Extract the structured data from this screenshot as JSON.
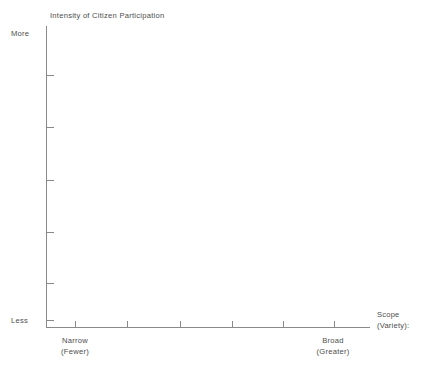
{
  "chart_data": {
    "type": "scatter",
    "title": "Intensity of Citizen Participation",
    "subtitle": "",
    "xlabel": "Scope (Variety):",
    "ylabel": "Intensity of Citizen Participation",
    "grid": false,
    "legend": null,
    "series": [],
    "annotations": [],
    "x_axis": {
      "label_line1": "Scope",
      "label_line2": "(Variety):",
      "low_end_line1": "Narrow",
      "low_end_line2": "(Fewer)",
      "high_end_line1": "Broad",
      "high_end_line2": "(Greater)",
      "tick_count": 6,
      "tick_positions": [
        75,
        127,
        180,
        232,
        283,
        334
      ],
      "tick_labels": [
        "",
        "",
        "",
        "",
        "",
        ""
      ]
    },
    "y_axis": {
      "label": "Intensity of Citizen Participation",
      "high_end": "More",
      "low_end": "Less",
      "tick_count": 6,
      "tick_positions": [
        75,
        127,
        180,
        232,
        283,
        320
      ],
      "tick_labels": [
        "",
        "",
        "",
        "",
        "",
        ""
      ]
    }
  },
  "figure": {
    "title": "Intensity of Citizen Participation",
    "y_axis_more_label": "More",
    "y_axis_less_label": "Less",
    "x_axis_narrow_label": "Narrow",
    "x_axis_narrow_sublabel": "(Fewer)",
    "x_axis_broad_label": "Broad",
    "x_axis_broad_sublabel": "(Greater)",
    "x_axis_title_line1": "Scope",
    "x_axis_title_line2": "(Variety):"
  },
  "style": {
    "axis_color": "#8a8a8a",
    "text_color": "#4d4d4d",
    "background": "#ffffff"
  }
}
